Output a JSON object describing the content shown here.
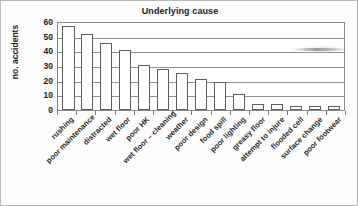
{
  "chart_data": {
    "type": "bar",
    "title": "Underlying cause",
    "xlabel": "",
    "ylabel": "no. accidents",
    "ylim": [
      0,
      60
    ],
    "yticks": [
      0,
      10,
      20,
      30,
      40,
      50,
      60
    ],
    "grid": true,
    "legend": null,
    "categories": [
      "rushing",
      "poor maintenance",
      "distracted",
      "wet floor",
      "poor HK",
      "wet floor – cleaning",
      "weather",
      "poor design",
      "food spill",
      "poor lighting",
      "greasy floor",
      "attempt to injure",
      "flooded cell",
      "surface change",
      "poor footwear"
    ],
    "values": [
      57,
      52,
      46,
      41,
      31,
      28,
      25,
      21,
      19,
      11,
      4,
      4,
      3,
      3,
      3
    ],
    "bar_style": {
      "fill": "#ffffff",
      "edge": "#5d5d5d"
    }
  },
  "figure": {
    "background": "#fdfdfd",
    "frame_color": "#8a8a8a",
    "grid_color": "#909090",
    "text_color": "#1a1a1a"
  }
}
